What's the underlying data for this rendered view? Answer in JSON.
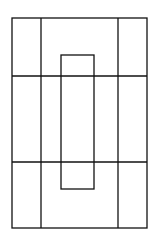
{
  "diagram": {
    "background": "#ffffff",
    "stroke": "#111111",
    "stroke_width": 1.3,
    "outer_rect": {
      "x": 12,
      "y": 18,
      "w": 135,
      "h": 210
    },
    "vertical_lines": [
      41,
      118
    ],
    "horizontal_lines": [
      76,
      162
    ],
    "inner_rect": {
      "x": 61,
      "y": 55,
      "w": 33,
      "h": 134
    }
  }
}
